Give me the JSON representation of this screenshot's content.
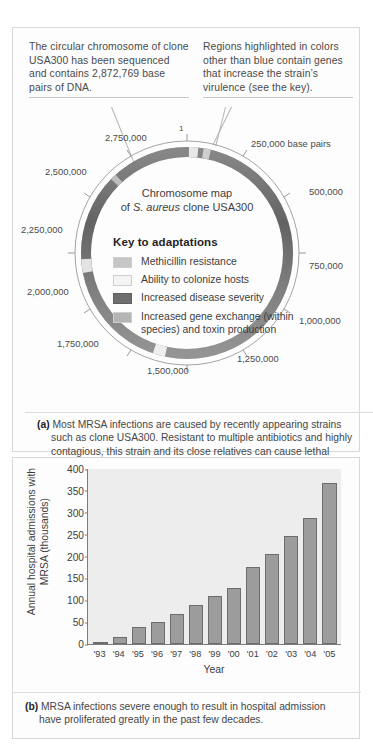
{
  "figure": {
    "panel_a": {
      "callouts": [
        "The circular chromosome of clone USA300 has been sequenced and contains 2,872,769 base pairs of DNA.",
        "Regions highlighted in colors other than blue contain genes that increase the strain’s virulence (see the key)."
      ],
      "map_title_line1": "Chromosome map",
      "map_title_line2_pre": "of ",
      "map_title_species": "S. aureus",
      "map_title_line2_post": " clone USA300",
      "ring_labels": [
        "1",
        "250,000 base pairs",
        "500,000",
        "750,000",
        "1,000,000",
        "1,250,000",
        "1,500,000",
        "1,750,000",
        "2,000,000",
        "2,250,000",
        "2,500,000",
        "2,750,000"
      ],
      "key_title": "Key to adaptations",
      "key_items": [
        {
          "label": "Methicillin resistance",
          "color": "#c6c6c6"
        },
        {
          "label": "Ability to colonize hosts",
          "color": "#f2f2f2"
        },
        {
          "label": "Increased disease severity",
          "color": "#6e6e6e"
        },
        {
          "label": "Increased gene exchange (within species) and toxin production",
          "color": "#b5b5b5"
        }
      ],
      "caption_label": "(a)",
      "caption_text": "Most MRSA infections are caused by recently appearing strains such as clone USA300. Resistant to multiple antibiotics and highly contagious, this strain and its close relatives can cause lethal infections of the skin, lungs, and blood. As shown here, researchers have identified key areas of the USA300 genome that code for adaptations that cause its virulent properties."
    },
    "panel_b": {
      "caption_label": "(b)",
      "caption_text": "MRSA infections severe enough to result in hospital admission have proliferated greatly in the past few decades."
    }
  },
  "chart_data": {
    "type": "bar",
    "title": "",
    "xlabel": "Year",
    "ylabel": "Annual hospital admissions with MRSA (thousands)",
    "categories": [
      "'93",
      "'94",
      "'95",
      "'96",
      "'97",
      "'98",
      "'99",
      "'00",
      "'01",
      "'02",
      "'03",
      "'04",
      "'05"
    ],
    "values": [
      3,
      17,
      38,
      50,
      69,
      89,
      109,
      128,
      175,
      206,
      247,
      288,
      368
    ],
    "ylim": [
      0,
      400
    ],
    "yticks": [
      0,
      50,
      100,
      150,
      200,
      250,
      300,
      350,
      400
    ],
    "grid": false,
    "legend": "none",
    "bar_color": "#9c9c9c",
    "plot_bg": "#ededed"
  }
}
